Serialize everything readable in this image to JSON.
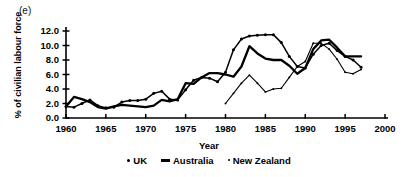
{
  "panel": {
    "label": "(e)"
  },
  "axes": {
    "ylabel": "% of civilian labour force",
    "xlabel": "Year",
    "yticks": [
      "0.0",
      "2.0",
      "4.0",
      "6.0",
      "8.0",
      "10.0",
      "12.0"
    ],
    "xticks": [
      "1960",
      "1965",
      "1970",
      "1975",
      "1980",
      "1985",
      "1990",
      "1995",
      "2000"
    ]
  },
  "legend": {
    "items": [
      {
        "label": "UK",
        "marker": "dot-marker-icon"
      },
      {
        "label": "Australia",
        "marker": "dash-marker-icon"
      },
      {
        "label": "New Zealand",
        "marker": "small-dot-marker-icon"
      }
    ]
  },
  "chart_data": {
    "type": "line",
    "title": "",
    "xlabel": "Year",
    "ylabel": "% of civilian labour force",
    "xlim": [
      1960,
      2000
    ],
    "ylim": [
      0.0,
      12.0
    ],
    "ytick_step": 2.0,
    "xtick_step": 5,
    "grid": false,
    "legend_position": "bottom-center",
    "series": [
      {
        "name": "UK",
        "marker": "dot",
        "x": [
          1960,
          1961,
          1962,
          1963,
          1964,
          1965,
          1966,
          1967,
          1968,
          1969,
          1970,
          1971,
          1972,
          1973,
          1974,
          1975,
          1976,
          1977,
          1978,
          1979,
          1980,
          1981,
          1982,
          1983,
          1984,
          1985,
          1986,
          1987,
          1988,
          1989,
          1990,
          1991,
          1992,
          1993,
          1994,
          1995,
          1996,
          1997
        ],
        "values": [
          1.6,
          1.5,
          2.0,
          2.5,
          1.7,
          1.4,
          1.5,
          2.2,
          2.4,
          2.4,
          2.6,
          3.4,
          3.7,
          2.6,
          2.5,
          3.9,
          5.2,
          5.6,
          5.5,
          5.0,
          6.3,
          9.4,
          10.9,
          11.3,
          11.4,
          11.5,
          11.5,
          10.4,
          8.5,
          7.1,
          6.9,
          8.8,
          10.0,
          10.3,
          9.3,
          8.5,
          8.0,
          7.0
        ]
      },
      {
        "name": "Australia",
        "marker": "line",
        "x": [
          1960,
          1961,
          1962,
          1963,
          1964,
          1965,
          1966,
          1967,
          1968,
          1969,
          1970,
          1971,
          1972,
          1973,
          1974,
          1975,
          1976,
          1977,
          1978,
          1979,
          1980,
          1981,
          1982,
          1983,
          1984,
          1985,
          1986,
          1987,
          1988,
          1989,
          1990,
          1991,
          1992,
          1993,
          1994,
          1995,
          1996,
          1997
        ],
        "values": [
          1.6,
          2.9,
          2.6,
          2.2,
          1.5,
          1.3,
          1.6,
          1.8,
          1.7,
          1.6,
          1.5,
          1.7,
          2.5,
          2.3,
          2.6,
          4.8,
          4.7,
          5.6,
          6.2,
          6.2,
          6.0,
          5.7,
          7.1,
          9.9,
          8.9,
          8.2,
          8.0,
          8.0,
          7.2,
          6.1,
          6.9,
          9.5,
          10.7,
          10.8,
          9.7,
          8.5,
          8.5,
          8.5
        ]
      },
      {
        "name": "New Zealand",
        "marker": "small-dot",
        "x": [
          1980,
          1981,
          1982,
          1983,
          1984,
          1985,
          1986,
          1987,
          1988,
          1989,
          1990,
          1991,
          1992,
          1993,
          1994,
          1995,
          1996,
          1997
        ],
        "values": [
          2.0,
          3.4,
          4.8,
          5.9,
          4.8,
          3.6,
          4.0,
          4.1,
          5.6,
          7.1,
          7.8,
          10.3,
          10.3,
          9.5,
          8.1,
          6.3,
          6.1,
          6.7
        ]
      }
    ]
  }
}
